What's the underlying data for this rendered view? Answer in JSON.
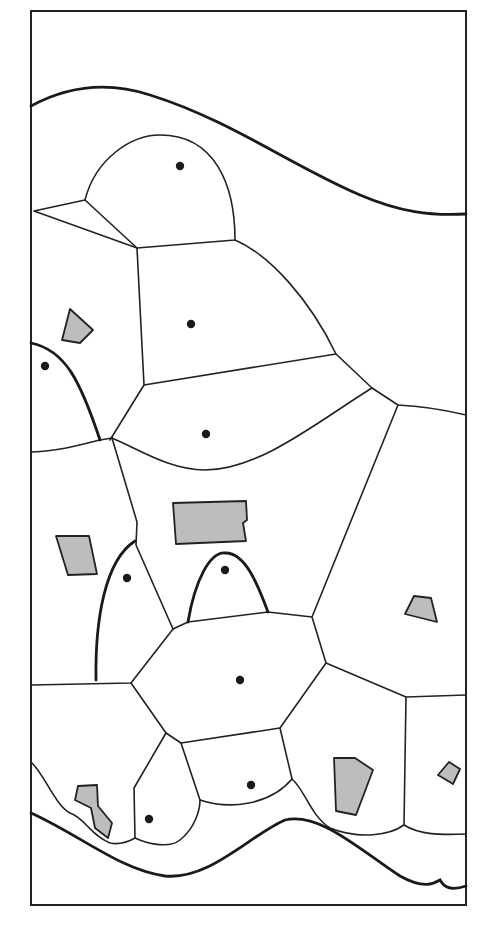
{
  "diagram": {
    "type": "voronoi-partition",
    "frame": {
      "x": 31,
      "y": 11,
      "width": 435,
      "height": 894
    },
    "colors": {
      "line": "#222222",
      "obstacle_fill": "#bdbdbd",
      "site": "#1a1a1a",
      "background": "#ffffff"
    },
    "boundaries": [
      {
        "name": "top-boundary-curve",
        "d": "M31,106 C70,85 110,82 150,95 C230,120 290,165 360,195 C400,212 430,216 466,214"
      },
      {
        "name": "bottom-boundary-curve",
        "d": "M31,813 C80,835 120,870 165,876 C210,880 250,835 285,820 C320,812 360,850 400,876 C425,890 435,883 440,880 C443,885 448,892 466,886"
      },
      {
        "name": "left-bump-curve",
        "d": "M31,343 C65,350 80,380 100,440"
      },
      {
        "name": "middle-left-bump",
        "d": "M96,680 C95,620 105,560 135,541"
      },
      {
        "name": "middle-center-bump",
        "d": "M188,622 C195,580 210,552 225,553 C245,552 258,585 268,612"
      }
    ],
    "edges": [
      "M34,211 L85,200 C95,160 130,135 160,135 C215,135 235,185 235,240 L137,248 Z",
      "M85,200 L137,248",
      "M137,248 L144,385 L110,440",
      "M235,240 C270,255 310,300 336,354 L144,385",
      "M336,354 L372,388 L398,405 C420,406 445,410 466,415",
      "M31,452 C60,452 90,442 100,440 L112,438",
      "M112,438 C140,450 170,470 205,470 C260,470 320,420 372,388",
      "M112,438 L137,522 L136,545 L173,629",
      "M398,405 L312,617 L268,612",
      "M173,629 L188,622 L268,612",
      "M173,629 L131,683 L31,685",
      "M312,617 L326,663 L406,697 L466,695",
      "M131,683 L166,733 L181,743",
      "M326,663 L280,728 L181,743",
      "M166,733 L134,788 L135,838",
      "M181,743 L200,800",
      "M280,728 L292,779",
      "M406,697 L404,825",
      "M31,762 C45,775 55,805 70,813 C85,818 90,835 110,843 C120,845 128,842 135,838",
      "M135,838 C150,845 170,848 180,840 C195,828 200,810 200,800",
      "M200,800 C230,810 270,805 292,779 C305,790 310,815 330,828 C360,840 390,835 404,825 C420,835 440,835 466,834"
    ],
    "obstacles": [
      {
        "name": "obstacle-top-left",
        "points": "70,309 93,330 80,343 62,340"
      },
      {
        "name": "obstacle-left-mid",
        "points": "56,536 89,536 97,574 68,575"
      },
      {
        "name": "obstacle-center-large",
        "points": "173,503 246,501 247,520 243,523 246,541 176,544"
      },
      {
        "name": "obstacle-right-small",
        "points": "405,614 414,596 431,598 437,622"
      },
      {
        "name": "obstacle-bottom-left",
        "points": "78,786 97,785 98,806 112,823 108,838 95,828 91,808 75,800"
      },
      {
        "name": "obstacle-bottom-center-right",
        "points": "334,758 355,758 373,770 356,815 336,811"
      },
      {
        "name": "obstacle-bottom-right-small",
        "points": "438,775 449,762 460,769 453,784"
      }
    ],
    "sites": [
      {
        "name": "site-1",
        "cx": 180,
        "cy": 166
      },
      {
        "name": "site-2",
        "cx": 191,
        "cy": 324
      },
      {
        "name": "site-3",
        "cx": 45,
        "cy": 366
      },
      {
        "name": "site-4",
        "cx": 206,
        "cy": 434
      },
      {
        "name": "site-5",
        "cx": 127,
        "cy": 578
      },
      {
        "name": "site-6",
        "cx": 225,
        "cy": 570
      },
      {
        "name": "site-7",
        "cx": 240,
        "cy": 680
      },
      {
        "name": "site-8",
        "cx": 251,
        "cy": 785
      },
      {
        "name": "site-9",
        "cx": 149,
        "cy": 819
      }
    ]
  }
}
